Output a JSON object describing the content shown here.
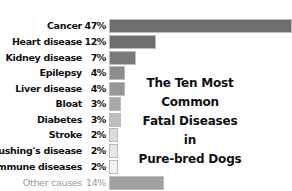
{
  "chart_data": {
    "type": "bar",
    "orientation": "horizontal",
    "title": "The Ten Most Common Fatal Diseases in Pure-bred Dogs",
    "title_lines": [
      "The Ten Most Common",
      "Fatal Diseases in",
      "Pure-bred Dogs"
    ],
    "categories": [
      "Cancer",
      "Heart disease",
      "Kidney disease",
      "Epilepsy",
      "Liver disease",
      "Bloat",
      "Diabetes",
      "Stroke",
      "Cushing's disease",
      "Immune diseases",
      "Other causes"
    ],
    "values": [
      47,
      12,
      7,
      4,
      4,
      3,
      3,
      2,
      2,
      2,
      14
    ],
    "labels": [
      "47%",
      "12%",
      "7%",
      "4%",
      "4%",
      "3%",
      "3%",
      "2%",
      "2%",
      "2%",
      "14%"
    ],
    "unit": "%",
    "xlabel": "",
    "ylabel": "",
    "grid": false,
    "legend": "none",
    "colors": [
      "#6e6e6e",
      "#6e6e6e",
      "#7a7a7a",
      "#8c8c8c",
      "#969696",
      "#a8a8a8",
      "#bdbdbd",
      "#dcdcdc",
      "#e6e6e6",
      "#f2f2f2",
      "#a0a0a0"
    ]
  }
}
